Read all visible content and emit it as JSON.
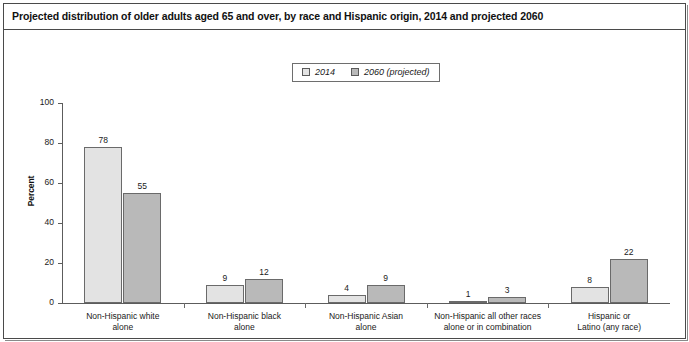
{
  "figure": {
    "title": "Projected distribution of older adults aged 65 and over, by race and Hispanic origin, 2014 and projected 2060"
  },
  "legend": {
    "position": "top-center",
    "entries": [
      {
        "label": "2014",
        "color": "#e3e3e3",
        "swatch_name": "legend-swatch-2014"
      },
      {
        "label": "2060 (projected)",
        "color": "#b9b9b9",
        "swatch_name": "legend-swatch-2060"
      }
    ]
  },
  "axes": {
    "ylabel": "Percent",
    "yticks": [
      "100",
      "80",
      "60",
      "40",
      "20",
      "0"
    ]
  },
  "chart_data": {
    "type": "bar",
    "title": "Projected distribution of older adults aged 65 and over, by race and Hispanic origin, 2014 and projected 2060",
    "xlabel": "",
    "ylabel": "Percent",
    "ylim": [
      0,
      100
    ],
    "ytick_values": [
      0,
      20,
      40,
      60,
      80,
      100
    ],
    "grid": false,
    "legend_position": "top-center",
    "categories": [
      "Non-Hispanic white\nalone",
      "Non-Hispanic black\nalone",
      "Non-Hispanic Asian\nalone",
      "Non-Hispanic all other races\nalone or in combination",
      "Hispanic or\nLatino (any race)"
    ],
    "series": [
      {
        "name": "2014",
        "color": "#e3e3e3",
        "values": [
          78,
          9,
          4,
          1,
          8
        ]
      },
      {
        "name": "2060 (projected)",
        "color": "#b9b9b9",
        "values": [
          55,
          12,
          9,
          3,
          22
        ]
      }
    ]
  }
}
